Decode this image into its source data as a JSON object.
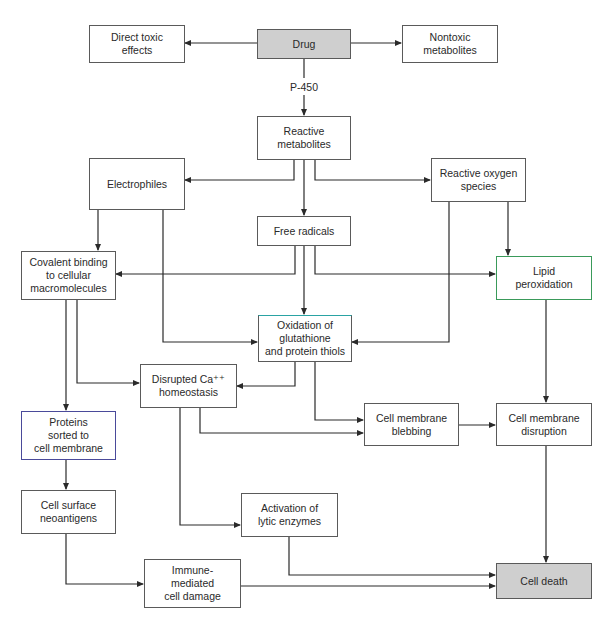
{
  "diagram": {
    "type": "flowchart",
    "title": "",
    "colors": {
      "border": "#5a5a5a",
      "shaded_fill": "#cfcfcf",
      "line": "#2a2a2a",
      "lipid_border": "#3a9a5a",
      "oxidation_top_border": "#2aa3a3"
    },
    "edge_label": "P-450",
    "nodes": {
      "drug": "Drug",
      "direct_toxic": "Direct toxic\neffects",
      "nontoxic": "Nontoxic\nmetabolites",
      "reactive_metabolites": "Reactive\nmetabolites",
      "electrophiles": "Electrophiles",
      "ros": "Reactive oxygen\nspecies",
      "free_radicals": "Free radicals",
      "covalent": "Covalent binding\nto cellular\nmacromolecules",
      "lipid": "Lipid\nperoxidation",
      "oxidation": "Oxidation of\nglutathione\nand protein thiols",
      "calcium": "Disrupted Ca⁺⁺\nhomeostasis",
      "blebbing": "Cell membrane\nblebbing",
      "disruption": "Cell membrane\ndisruption",
      "proteins": "Proteins\nsorted to\ncell membrane",
      "neoantigens": "Cell surface\nneoantigens",
      "lytic": "Activation of\nlytic enzymes",
      "immune": "Immune-\nmediated\ncell damage",
      "cell_death": "Cell death"
    },
    "edges": [
      {
        "from": "Drug",
        "to": "Direct toxic effects"
      },
      {
        "from": "Drug",
        "to": "Nontoxic metabolites"
      },
      {
        "from": "Drug",
        "to": "Reactive metabolites",
        "label": "P-450"
      },
      {
        "from": "Reactive metabolites",
        "to": "Electrophiles"
      },
      {
        "from": "Reactive metabolites",
        "to": "Free radicals"
      },
      {
        "from": "Reactive metabolites",
        "to": "Reactive oxygen species"
      },
      {
        "from": "Electrophiles",
        "to": "Covalent binding to cellular macromolecules"
      },
      {
        "from": "Electrophiles",
        "to": "Oxidation of glutathione and protein thiols"
      },
      {
        "from": "Free radicals",
        "to": "Covalent binding to cellular macromolecules"
      },
      {
        "from": "Free radicals",
        "to": "Oxidation of glutathione and protein thiols"
      },
      {
        "from": "Free radicals",
        "to": "Lipid peroxidation"
      },
      {
        "from": "Reactive oxygen species",
        "to": "Oxidation of glutathione and protein thiols"
      },
      {
        "from": "Reactive oxygen species",
        "to": "Lipid peroxidation"
      },
      {
        "from": "Covalent binding to cellular macromolecules",
        "to": "Proteins sorted to cell membrane"
      },
      {
        "from": "Covalent binding to cellular macromolecules",
        "to": "Disrupted Ca++ homeostasis"
      },
      {
        "from": "Oxidation of glutathione and protein thiols",
        "to": "Disrupted Ca++ homeostasis"
      },
      {
        "from": "Oxidation of glutathione and protein thiols",
        "to": "Cell membrane blebbing"
      },
      {
        "from": "Disrupted Ca++ homeostasis",
        "to": "Cell membrane blebbing"
      },
      {
        "from": "Disrupted Ca++ homeostasis",
        "to": "Activation of lytic enzymes"
      },
      {
        "from": "Cell membrane blebbing",
        "to": "Cell membrane disruption"
      },
      {
        "from": "Lipid peroxidation",
        "to": "Cell membrane disruption"
      },
      {
        "from": "Proteins sorted to cell membrane",
        "to": "Cell surface neoantigens"
      },
      {
        "from": "Cell surface neoantigens",
        "to": "Immune-mediated cell damage"
      },
      {
        "from": "Activation of lytic enzymes",
        "to": "Cell death"
      },
      {
        "from": "Immune-mediated cell damage",
        "to": "Cell death"
      },
      {
        "from": "Cell membrane disruption",
        "to": "Cell death"
      }
    ]
  }
}
